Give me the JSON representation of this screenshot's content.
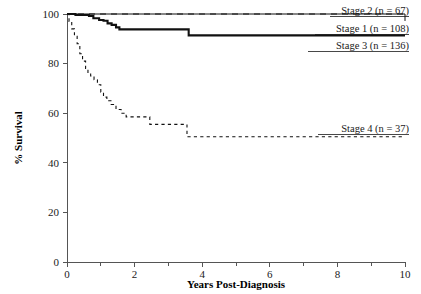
{
  "chart_data": {
    "type": "line",
    "title": "",
    "subtitle": "",
    "xlabel": "Years Post-Diagnosis",
    "ylabel": "% Survival",
    "xlim": [
      0,
      10
    ],
    "ylim": [
      0,
      100
    ],
    "xticks": [
      0,
      1,
      2,
      3,
      4,
      5,
      6,
      7,
      8,
      9,
      10
    ],
    "xticklabels": [
      "0",
      "",
      "2",
      "",
      "4",
      "",
      "6",
      "",
      "8",
      "",
      "10"
    ],
    "yticks": [
      0,
      20,
      40,
      60,
      80,
      100
    ],
    "yticklabels": [
      "0",
      "20",
      "40",
      "60",
      "80",
      "100"
    ],
    "grid": false,
    "legend_position": "inline-right-annotations",
    "curve_style": "step-post",
    "series": [
      {
        "name": "Stage 1",
        "n": 108,
        "label": "Stage 1 (n = 108)",
        "style": "thin-solid",
        "x": [
          0.0,
          5.2,
          10.0
        ],
        "y": [
          100.0,
          100.0,
          97.2
        ]
      },
      {
        "name": "Stage 2",
        "n": 67,
        "label": "Stage 2 (n = 67)",
        "style": "wide-dashed",
        "x": [
          0.0,
          5.2,
          10.0
        ],
        "y": [
          100.0,
          100.0,
          100.0
        ]
      },
      {
        "name": "Stage 3",
        "n": 136,
        "label": "Stage 3 (n = 136)",
        "style": "thick-solid",
        "x": [
          0.0,
          0.25,
          0.65,
          0.78,
          0.95,
          1.08,
          1.2,
          1.32,
          1.45,
          1.55,
          3.45,
          3.6,
          10.0
        ],
        "y": [
          100.0,
          99.6,
          99.2,
          98.3,
          97.6,
          97.3,
          96.2,
          95.6,
          94.6,
          93.8,
          93.8,
          91.4,
          91.4
        ]
      },
      {
        "name": "Stage 4",
        "n": 37,
        "label": "Stage 4 (n = 37)",
        "style": "fine-dashed",
        "x": [
          0.0,
          0.06,
          0.14,
          0.22,
          0.3,
          0.38,
          0.46,
          0.55,
          0.62,
          0.7,
          0.8,
          0.9,
          1.0,
          1.08,
          1.18,
          1.3,
          1.45,
          1.6,
          1.75,
          1.95,
          2.3,
          2.45,
          3.45,
          3.55,
          10.0
        ],
        "y": [
          100.0,
          97.0,
          94.0,
          91.0,
          88.0,
          84.0,
          81.0,
          78.0,
          76.0,
          75.0,
          73.5,
          71.5,
          68.5,
          66.5,
          65.0,
          63.5,
          61.5,
          60.0,
          58.5,
          58.5,
          58.5,
          55.5,
          55.5,
          50.5,
          50.5
        ]
      }
    ],
    "annotations": [
      {
        "text": "Stage 2 (n = 67)",
        "series": "Stage 2"
      },
      {
        "text": "Stage 1 (n = 108)",
        "series": "Stage 1"
      },
      {
        "text": "Stage 3 (n = 136)",
        "series": "Stage 3"
      },
      {
        "text": "Stage 4 (n = 37)",
        "series": "Stage 4"
      }
    ]
  }
}
